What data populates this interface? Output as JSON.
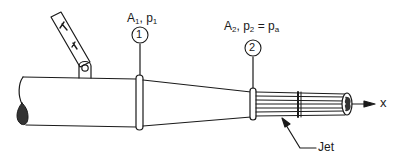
{
  "figure": {
    "type": "schematic",
    "stroke_color": "#1a1a1a",
    "background": "#ffffff"
  },
  "sections": [
    {
      "number": "1",
      "area_symbol": "A",
      "area_subscript": "1",
      "pressure_symbol": "p",
      "pressure_subscript": "1",
      "label_text": "A1, p1"
    },
    {
      "number": "2",
      "area_symbol": "A",
      "area_subscript": "2",
      "pressure_symbol": "p",
      "pressure_subscript": "2",
      "equals": "=",
      "ambient_symbol": "p",
      "ambient_subscript": "a",
      "label_text": "A2, p2 = pa"
    }
  ],
  "labels": {
    "jet": "Jet",
    "axis": "x"
  }
}
